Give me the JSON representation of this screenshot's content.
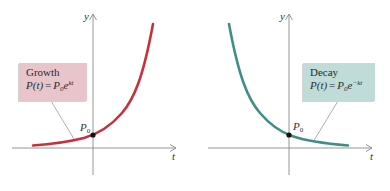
{
  "colors": {
    "growth_curve": "#c8303c",
    "decay_curve": "#3f8f86",
    "growth_box": "#e7c5cb",
    "decay_box": "#bfdcd8",
    "axis": "#8a8a8a",
    "text": "#2b2b2b"
  },
  "panels": [
    {
      "id": "growth",
      "axis_x_label": "t",
      "axis_y_label": "y",
      "point_label": "P",
      "point_label_sub": "0",
      "box": {
        "title": "Growth",
        "formula_lhs": "P(t)",
        "formula_eq": "=",
        "formula_base": "P",
        "formula_base_sub": "0",
        "formula_e": "e",
        "formula_exp": "kt"
      }
    },
    {
      "id": "decay",
      "axis_x_label": "t",
      "axis_y_label": "y",
      "point_label": "P",
      "point_label_sub": "0",
      "box": {
        "title": "Decay",
        "formula_lhs": "P(t)",
        "formula_eq": "=",
        "formula_base": "P",
        "formula_base_sub": "0",
        "formula_e": "e",
        "formula_exp": "−kt"
      }
    }
  ]
}
